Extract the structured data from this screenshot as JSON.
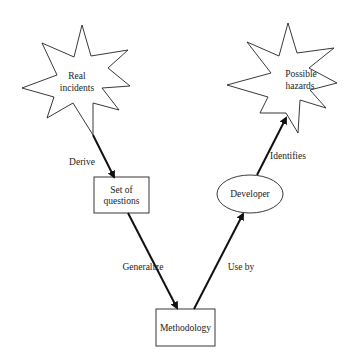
{
  "diagram": {
    "type": "flow",
    "nodes": [
      {
        "id": "real-incidents",
        "shape": "star",
        "lines": [
          "Real",
          "incidents"
        ]
      },
      {
        "id": "set-of-questions",
        "shape": "rectangle",
        "lines": [
          "Set of",
          "questions"
        ]
      },
      {
        "id": "methodology",
        "shape": "rectangle",
        "lines": [
          "Methodology"
        ]
      },
      {
        "id": "developer",
        "shape": "ellipse",
        "lines": [
          "Developer"
        ]
      },
      {
        "id": "possible-hazards",
        "shape": "star",
        "lines": [
          "Possible",
          "hazards"
        ]
      }
    ],
    "edges": [
      {
        "from": "real-incidents",
        "to": "set-of-questions",
        "label": "Derive"
      },
      {
        "from": "set-of-questions",
        "to": "methodology",
        "label": "Generalize"
      },
      {
        "from": "methodology",
        "to": "developer",
        "label": "Use by"
      },
      {
        "from": "developer",
        "to": "possible-hazards",
        "label": "Identifies"
      }
    ]
  },
  "colors": {
    "background": "#ffffff",
    "stroke": "#222222",
    "text": "#222222"
  }
}
